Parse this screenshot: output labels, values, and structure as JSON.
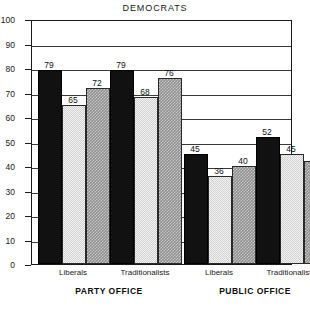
{
  "chart_data": {
    "type": "bar",
    "title": "DEMOCRATS",
    "xlabel": "",
    "ylabel": "",
    "ylim": [
      0,
      100
    ],
    "yticks": [
      0,
      10,
      20,
      30,
      40,
      50,
      60,
      70,
      80,
      90,
      100
    ],
    "grid": true,
    "legend_position": "none",
    "group_labels": [
      "PARTY OFFICE",
      "PUBLIC OFFICE"
    ],
    "categories": [
      "Liberals",
      "Traditionalists",
      "Liberals",
      "Traditionalists"
    ],
    "series": [
      {
        "name": "bar-1",
        "style": "black",
        "values": [
          79,
          79,
          45,
          52
        ]
      },
      {
        "name": "bar-2",
        "style": "light",
        "values": [
          65,
          68,
          36,
          45
        ]
      },
      {
        "name": "bar-3",
        "style": "medium",
        "values": [
          72,
          76,
          40,
          42
        ]
      }
    ],
    "bars": [
      {
        "value": 79,
        "style": "black",
        "group": 0,
        "category": "Liberals"
      },
      {
        "value": 65,
        "style": "light",
        "group": 0,
        "category": "Liberals"
      },
      {
        "value": 72,
        "style": "medium",
        "group": 0,
        "category": "Liberals"
      },
      {
        "value": 79,
        "style": "black",
        "group": 0,
        "category": "Traditionalists"
      },
      {
        "value": 68,
        "style": "light",
        "group": 0,
        "category": "Traditionalists"
      },
      {
        "value": 76,
        "style": "medium",
        "group": 0,
        "category": "Traditionalists"
      },
      {
        "value": 45,
        "style": "black",
        "group": 1,
        "category": "Liberals"
      },
      {
        "value": 36,
        "style": "light",
        "group": 1,
        "category": "Liberals"
      },
      {
        "value": 40,
        "style": "medium",
        "group": 1,
        "category": "Liberals"
      },
      {
        "value": 52,
        "style": "black",
        "group": 1,
        "category": "Traditionalists"
      },
      {
        "value": 45,
        "style": "light",
        "group": 1,
        "category": "Traditionalists"
      },
      {
        "value": 42,
        "style": "medium",
        "group": 1,
        "category": "Traditionalists"
      }
    ],
    "colors": {
      "black_bar": "#111111",
      "light_bar": "#d2d2d2",
      "medium_bar": "#8f8f8f",
      "axis": "#1a1a1a",
      "grid": "#3a3a3a",
      "background": "#ffffff"
    }
  }
}
